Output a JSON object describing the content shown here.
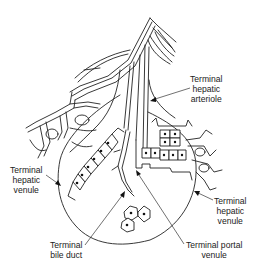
{
  "figure": {
    "colors": {
      "line": "#222222",
      "background": "#ffffff"
    }
  },
  "labels": [
    {
      "id": "terminal-hepatic-arteriole",
      "lines": [
        "Terminal",
        "hepatic",
        "arteriole"
      ]
    },
    {
      "id": "terminal-hepatic-venule-left",
      "lines": [
        "Terminal",
        "hepatic",
        "venule"
      ]
    },
    {
      "id": "terminal-hepatic-venule-right",
      "lines": [
        "Terminal",
        "hepatic",
        "venule"
      ]
    },
    {
      "id": "terminal-bile-duct",
      "lines": [
        "Terminal",
        "bile duct"
      ]
    },
    {
      "id": "terminal-portal-venule",
      "lines": [
        "Terminal portal",
        "venule"
      ]
    }
  ]
}
